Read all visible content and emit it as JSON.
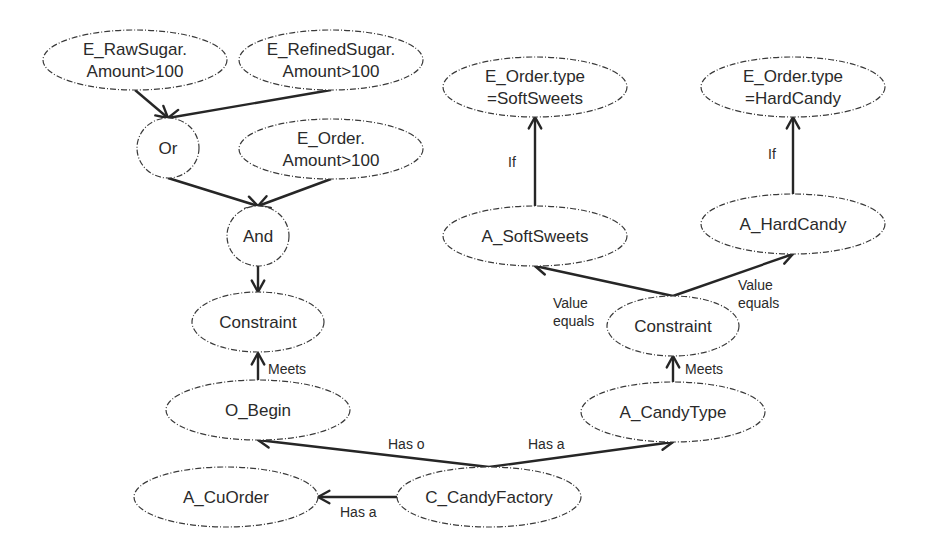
{
  "diagram": {
    "type": "goal-constraint graph",
    "colors": {
      "background": "#ffffff",
      "stroke": "#262626",
      "text": "#2a2a2a"
    },
    "nodes": [
      {
        "id": "raw_sugar",
        "shape": "ellipse",
        "lines": [
          "E_RawSugar.",
          "Amount>100"
        ],
        "cx": 135,
        "cy": 60,
        "rx": 92,
        "ry": 30
      },
      {
        "id": "refined_sugar",
        "shape": "ellipse",
        "lines": [
          "E_RefinedSugar.",
          "Amount>100"
        ],
        "cx": 331,
        "cy": 60,
        "rx": 92,
        "ry": 30
      },
      {
        "id": "or",
        "shape": "circle",
        "lines": [
          "Or"
        ],
        "cx": 168,
        "cy": 148,
        "rx": 31,
        "ry": 30
      },
      {
        "id": "order_amount",
        "shape": "ellipse",
        "lines": [
          "E_Order.",
          "Amount>100"
        ],
        "cx": 331,
        "cy": 149,
        "rx": 92,
        "ry": 30
      },
      {
        "id": "and",
        "shape": "circle",
        "lines": [
          "And"
        ],
        "cx": 258,
        "cy": 236,
        "rx": 31,
        "ry": 30
      },
      {
        "id": "constraint_left",
        "shape": "ellipse",
        "lines": [
          "Constraint"
        ],
        "cx": 258,
        "cy": 322,
        "rx": 66,
        "ry": 30
      },
      {
        "id": "o_begin",
        "shape": "ellipse",
        "lines": [
          "O_Begin"
        ],
        "cx": 258,
        "cy": 410,
        "rx": 92,
        "ry": 30
      },
      {
        "id": "a_cuorder",
        "shape": "ellipse",
        "lines": [
          "A_CuOrder"
        ],
        "cx": 226,
        "cy": 497,
        "rx": 92,
        "ry": 30
      },
      {
        "id": "c_candyfactory",
        "shape": "ellipse",
        "lines": [
          "C_CandyFactory"
        ],
        "cx": 489,
        "cy": 497,
        "rx": 92,
        "ry": 30
      },
      {
        "id": "a_candytype",
        "shape": "ellipse",
        "lines": [
          "A_CandyType"
        ],
        "cx": 673,
        "cy": 412,
        "rx": 92,
        "ry": 30
      },
      {
        "id": "constraint_right",
        "shape": "ellipse",
        "lines": [
          "Constraint"
        ],
        "cx": 673,
        "cy": 326,
        "rx": 66,
        "ry": 30
      },
      {
        "id": "a_softsweets",
        "shape": "ellipse",
        "lines": [
          "A_SoftSweets"
        ],
        "cx": 535,
        "cy": 236,
        "rx": 92,
        "ry": 30
      },
      {
        "id": "a_hardcandy",
        "shape": "ellipse",
        "lines": [
          "A_HardCandy"
        ],
        "cx": 793,
        "cy": 224,
        "rx": 92,
        "ry": 30
      },
      {
        "id": "order_type_soft",
        "shape": "ellipse",
        "lines": [
          "E_Order.type",
          "=SoftSweets"
        ],
        "cx": 535,
        "cy": 87,
        "rx": 92,
        "ry": 30
      },
      {
        "id": "order_type_hard",
        "shape": "ellipse",
        "lines": [
          "E_Order.type",
          "=HardCandy"
        ],
        "cx": 793,
        "cy": 87,
        "rx": 92,
        "ry": 30
      }
    ],
    "edges": [
      {
        "from": "raw_sugar",
        "to": "or",
        "label": "",
        "x1": 135,
        "y1": 90,
        "x2": 168,
        "y2": 118
      },
      {
        "from": "refined_sugar",
        "to": "or",
        "label": "",
        "x1": 331,
        "y1": 90,
        "x2": 168,
        "y2": 118
      },
      {
        "from": "or",
        "to": "and",
        "label": "",
        "x1": 168,
        "y1": 178,
        "x2": 258,
        "y2": 206
      },
      {
        "from": "order_amount",
        "to": "and",
        "label": "",
        "x1": 331,
        "y1": 179,
        "x2": 258,
        "y2": 206
      },
      {
        "from": "and",
        "to": "constraint_left",
        "label": "",
        "x1": 258,
        "y1": 266,
        "x2": 258,
        "y2": 292
      },
      {
        "from": "o_begin",
        "to": "constraint_left",
        "label": "Meets",
        "x1": 258,
        "y1": 380,
        "x2": 258,
        "y2": 353,
        "lx": 268,
        "ly": 374
      },
      {
        "from": "c_candyfactory",
        "to": "o_begin",
        "label": "Has o",
        "x1": 489,
        "y1": 467,
        "x2": 258,
        "y2": 440,
        "lx": 388,
        "ly": 449
      },
      {
        "from": "c_candyfactory",
        "to": "a_candytype",
        "label": "Has a",
        "x1": 489,
        "y1": 467,
        "x2": 673,
        "y2": 442,
        "lx": 528,
        "ly": 449
      },
      {
        "from": "c_candyfactory",
        "to": "a_cuorder",
        "label": "Has a",
        "x1": 397,
        "y1": 497,
        "x2": 318,
        "y2": 497,
        "lx": 340,
        "ly": 517
      },
      {
        "from": "a_candytype",
        "to": "constraint_right",
        "label": "Meets",
        "x1": 673,
        "y1": 382,
        "x2": 673,
        "y2": 356,
        "lx": 685,
        "ly": 374
      },
      {
        "from": "constraint_right",
        "to": "a_softsweets",
        "label": "Value\nequals",
        "x1": 673,
        "y1": 296,
        "x2": 535,
        "y2": 266,
        "lx": 553,
        "ly": 308
      },
      {
        "from": "constraint_right",
        "to": "a_hardcandy",
        "label": "Value\nequals",
        "x1": 673,
        "y1": 296,
        "x2": 793,
        "y2": 254,
        "lx": 738,
        "ly": 290
      },
      {
        "from": "a_softsweets",
        "to": "order_type_soft",
        "label": "If",
        "x1": 535,
        "y1": 206,
        "x2": 535,
        "y2": 117,
        "lx": 508,
        "ly": 167
      },
      {
        "from": "a_hardcandy",
        "to": "order_type_hard",
        "label": "If",
        "x1": 793,
        "y1": 194,
        "x2": 793,
        "y2": 117,
        "lx": 768,
        "ly": 159
      }
    ]
  }
}
